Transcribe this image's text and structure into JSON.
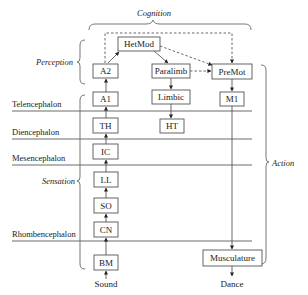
{
  "groups": {
    "cognition": "Cognition",
    "perception": "Perception",
    "sensation": "Sensation",
    "action": "Action"
  },
  "regions": [
    {
      "id": "telencephalon",
      "label": "Telencephalon"
    },
    {
      "id": "diencephalon",
      "label": "Diencephalon"
    },
    {
      "id": "mesencephalon",
      "label": "Mesencephalon"
    },
    {
      "id": "rhombencephalon",
      "label": "Rhombencephalon"
    }
  ],
  "nodes": {
    "hetmod": "HetMod",
    "a2": "A2",
    "a1": "A1",
    "th": "TH",
    "ic": "IC",
    "ll": "LL",
    "so": "SO",
    "cn": "CN",
    "bm": "BM",
    "paralimb": "Paralimb",
    "limbic": "Limbic",
    "ht": "HT",
    "premot": "PreMot",
    "m1": "M1",
    "musculature": "Musculature"
  },
  "io": {
    "input": "Sound",
    "output": "Dance"
  },
  "edges": [
    {
      "from": "Sound",
      "to": "BM",
      "style": "solid"
    },
    {
      "from": "BM",
      "to": "CN",
      "style": "solid"
    },
    {
      "from": "CN",
      "to": "SO",
      "style": "solid"
    },
    {
      "from": "SO",
      "to": "LL",
      "style": "solid"
    },
    {
      "from": "LL",
      "to": "IC",
      "style": "solid"
    },
    {
      "from": "IC",
      "to": "TH",
      "style": "solid"
    },
    {
      "from": "TH",
      "to": "A1",
      "style": "solid"
    },
    {
      "from": "A1",
      "to": "A2",
      "style": "solid"
    },
    {
      "from": "A2",
      "to": "HetMod",
      "style": "solid"
    },
    {
      "from": "HetMod",
      "to": "Paralimb",
      "style": "solid"
    },
    {
      "from": "HetMod",
      "to": "PreMot",
      "style": "dashed"
    },
    {
      "from": "A2",
      "to": "PreMot",
      "style": "dashed"
    },
    {
      "from": "Paralimb",
      "to": "PreMot",
      "style": "dashed"
    },
    {
      "from": "Paralimb",
      "to": "Limbic",
      "style": "solid"
    },
    {
      "from": "Limbic",
      "to": "HT",
      "style": "solid"
    },
    {
      "from": "PreMot",
      "to": "M1",
      "style": "solid"
    },
    {
      "from": "M1",
      "to": "Musculature",
      "style": "solid"
    },
    {
      "from": "Musculature",
      "to": "Dance",
      "style": "solid"
    }
  ],
  "colors": {
    "line": "#444444",
    "box_stroke": "#555555",
    "background": "#ffffff"
  }
}
